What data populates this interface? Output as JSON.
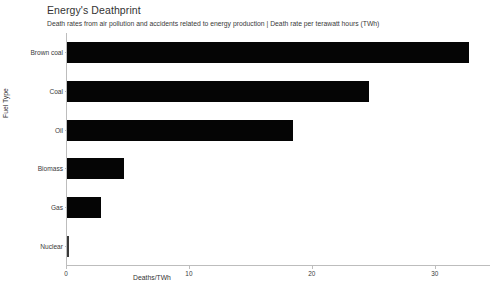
{
  "chart_data": {
    "type": "bar",
    "orientation": "horizontal",
    "title": "Energy's Deathprint",
    "subtitle": "Death rates from air pollution and accidents related to energy production | Death rate per terawatt hours (TWh)",
    "xlabel": "Deaths/TWh",
    "ylabel": "Fuel Type",
    "categories": [
      "Brown coal",
      "Coal",
      "Oil",
      "Biomass",
      "Gas",
      "Nuclear"
    ],
    "values": [
      32.7,
      24.6,
      18.4,
      4.6,
      2.8,
      0.07
    ],
    "xticks": [
      0,
      10,
      20,
      30
    ],
    "xtick_labels": [
      "0",
      "10",
      "20",
      "30"
    ],
    "xlim": [
      0,
      34.5
    ],
    "grid": false,
    "legend": "none",
    "bar_color": "#050505"
  }
}
